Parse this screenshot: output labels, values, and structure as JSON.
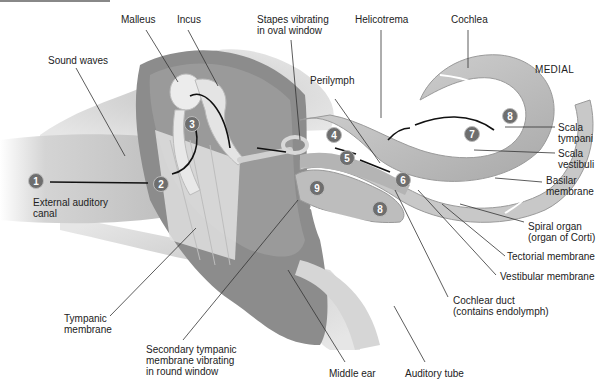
{
  "figure": {
    "orientation_label": "MEDIAL",
    "labels": {
      "malleus": "Malleus",
      "incus": "Incus",
      "stapes": "Stapes vibrating\nin oval window",
      "helicotrema": "Helicotrema",
      "cochlea": "Cochlea",
      "sound_waves": "Sound waves",
      "perilymph": "Perilymph",
      "scala_tympani": "Scala\ntympani",
      "scala_vestibuli": "Scala\nvestibuli",
      "basilar_membrane": "Basilar\nmembrane",
      "external_auditory_canal": "External auditory\ncanal",
      "spiral_organ": "Spiral organ\n(organ of Corti)",
      "tectorial_membrane": "Tectorial membrane",
      "vestibular_membrane": "Vestibular membrane",
      "tympanic_membrane": "Tympanic\nmembrane",
      "cochlear_duct": "Cochlear duct\n(contains endolymph)",
      "secondary_tympanic_membrane": "Secondary tympanic\nmembrane vibrating\nin round window",
      "middle_ear": "Middle ear",
      "auditory_tube": "Auditory tube"
    },
    "steps": [
      "1",
      "2",
      "3",
      "4",
      "5",
      "6",
      "7",
      "8",
      "8",
      "9"
    ]
  }
}
